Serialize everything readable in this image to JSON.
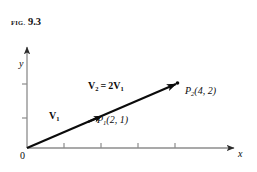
{
  "figure": {
    "caption_prefix": "FIG.",
    "caption_number": "9.3"
  },
  "axes": {
    "x_label": "x",
    "y_label": "y",
    "origin_label": "0",
    "x_tick_count": 4,
    "y_tick_count": 2,
    "x_axis_color": "#8c8c8c",
    "y_axis_color": "#8c8c8c",
    "grid": false
  },
  "vectors": [
    {
      "name": "V1",
      "label_main": "V",
      "label_sub": "1",
      "from": [
        0,
        0
      ],
      "to": [
        2,
        1
      ]
    },
    {
      "name": "V2",
      "label_main": "V",
      "label_sub": "2",
      "equals": "=",
      "expression_coefficient": "2",
      "expression_main": "V",
      "expression_sub": "1",
      "from": [
        0,
        0
      ],
      "to": [
        4,
        2
      ]
    }
  ],
  "points": [
    {
      "name": "P1",
      "label_main": "P",
      "label_sub": "1",
      "coords_text": "(2, 1)",
      "x": 2,
      "y": 1
    },
    {
      "name": "P2",
      "label_main": "P",
      "label_sub": "2",
      "coords_text": "(4, 2)",
      "x": 4,
      "y": 2
    }
  ],
  "colors": {
    "ink": "#0b0b0b",
    "axis": "#8c8c8c",
    "background": "#ffffff"
  }
}
